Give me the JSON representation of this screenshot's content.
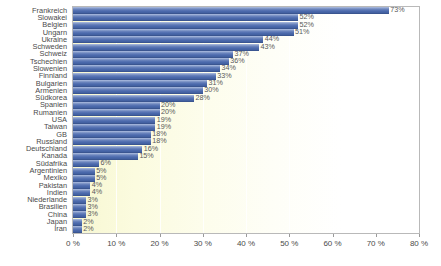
{
  "chart_data": {
    "type": "bar",
    "orientation": "horizontal",
    "title": "",
    "subtitle": "",
    "xlabel": "",
    "ylabel": "",
    "xlim": [
      0,
      80
    ],
    "xtick_labels": [
      "0 %",
      "10 %",
      "20 %",
      "30 %",
      "40 %",
      "50 %",
      "60 %",
      "70 %",
      "80 %"
    ],
    "xticks": [
      0,
      10,
      20,
      30,
      40,
      50,
      60,
      70,
      80
    ],
    "grid": true,
    "grid_axis": "x",
    "legend": false,
    "value_label_suffix": "%",
    "categories": [
      "Frankreich",
      "Slowakei",
      "Belgien",
      "Ungarn",
      "Ukraine",
      "Schweden",
      "Schweiz",
      "Tschechien",
      "Slowenien",
      "Finnland",
      "Bulgarien",
      "Armenien",
      "Südkorea",
      "Spanien",
      "Rumanien",
      "USA",
      "Taiwan",
      "GB",
      "Russland",
      "Deutschland",
      "Kanada",
      "Südafrika",
      "Argentinien",
      "Mexiko",
      "Pakistan",
      "Indien",
      "Niederlande",
      "Brasilien",
      "China",
      "Japan",
      "Iran"
    ],
    "values": [
      73,
      52,
      52,
      51,
      44,
      43,
      37,
      36,
      34,
      33,
      31,
      30,
      28,
      20,
      20,
      19,
      19,
      18,
      18,
      16,
      15,
      6,
      5,
      5,
      4,
      4,
      3,
      3,
      3,
      2,
      2
    ],
    "value_labels": [
      "73%",
      "52%",
      "52%",
      "51%",
      "44%",
      "43%",
      "37%",
      "36%",
      "34%",
      "33%",
      "31%",
      "30%",
      "28%",
      "20%",
      "20%",
      "19%",
      "19%",
      "18%",
      "18%",
      "16%",
      "15%",
      "6%",
      "5%",
      "5%",
      "4%",
      "4%",
      "3%",
      "3%",
      "3%",
      "2%",
      "2%"
    ],
    "colors": {
      "bar": "#4d6bae",
      "bar_highlight": "#8fa4cf",
      "bar_shadow": "#3a5590",
      "plot_background_left": "#f7f7d2",
      "plot_background_right": "#ffffff",
      "plot_border": "#b9b9b9",
      "label_text": "#4a4a4a",
      "value_text": "#585858",
      "gridline": "#ffffff"
    }
  }
}
